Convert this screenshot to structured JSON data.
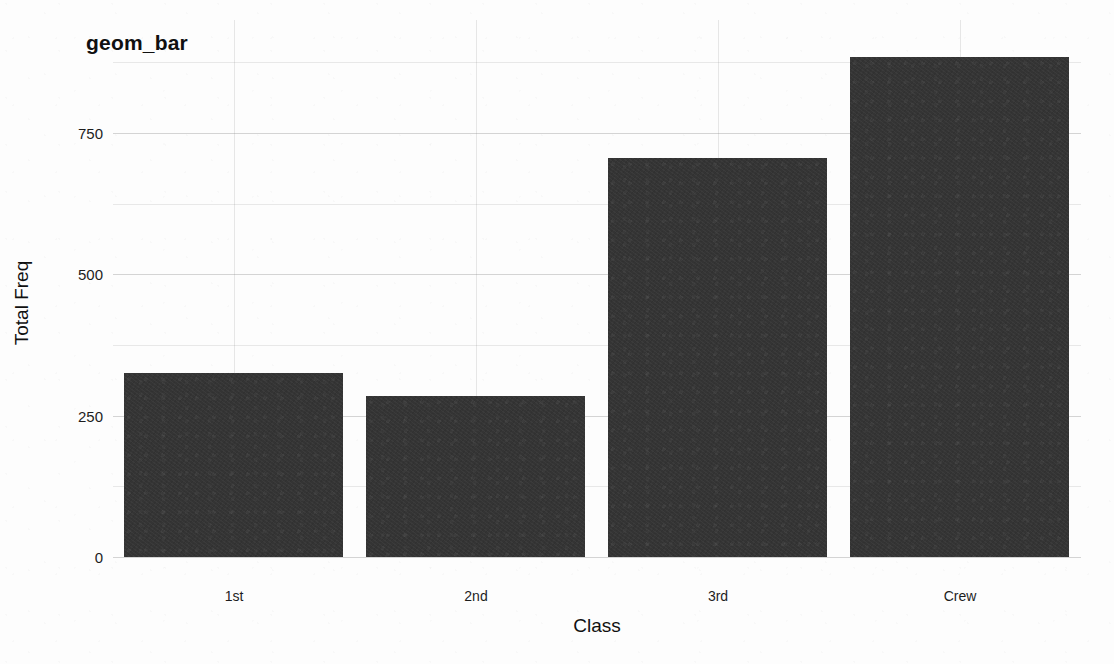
{
  "chart_data": {
    "type": "bar",
    "title": "geom_bar",
    "xlabel": "Class",
    "ylabel": "Total Freq",
    "categories": [
      "1st",
      "2nd",
      "3rd",
      "Crew"
    ],
    "values": [
      325,
      285,
      706,
      885
    ],
    "ylim": [
      0,
      950
    ],
    "y_ticks": [
      0,
      250,
      500,
      750
    ],
    "y_tick_labels": [
      "0",
      "250",
      "500",
      "750"
    ],
    "y_minor_ticks": [
      125,
      375,
      625,
      875
    ],
    "grid": "major-and-minor",
    "legend": "none",
    "bar_color": "#343434",
    "background_color": "#ffffff",
    "gridline_color": "#bdbdbd"
  },
  "figure": {
    "title": "geom_bar",
    "x_axis_title": "Class",
    "y_axis_title": "Total Freq"
  }
}
